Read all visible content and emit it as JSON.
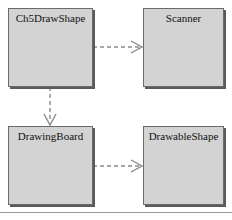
{
  "diagram": {
    "type": "uml-class-dependency-diagram",
    "background_color": "#ffffff",
    "box_fill_color": "#d3d3d3",
    "box_border_color": "#6b6b6b",
    "connector_color": "#8a8a8a",
    "rule_color": "#9a9a9a",
    "classes": [
      {
        "id": "ch5drawshape",
        "label": "Ch5DrawShape"
      },
      {
        "id": "scanner",
        "label": "Scanner"
      },
      {
        "id": "drawingboard",
        "label": "DrawingBoard"
      },
      {
        "id": "drawableshape",
        "label": "DrawableShape"
      }
    ],
    "relationships": [
      {
        "id": "dep-ch5drawshape-scanner",
        "from": "Ch5DrawShape",
        "to": "Scanner",
        "style": "dashed",
        "arrow": "open",
        "kind": "dependency",
        "direction": "horizontal"
      },
      {
        "id": "dep-ch5drawshape-drawingboard",
        "from": "Ch5DrawShape",
        "to": "DrawingBoard",
        "style": "dashed",
        "arrow": "open",
        "kind": "dependency",
        "direction": "vertical"
      },
      {
        "id": "dep-drawingboard-drawableshape",
        "from": "DrawingBoard",
        "to": "DrawableShape",
        "style": "dashed",
        "arrow": "open",
        "kind": "dependency",
        "direction": "horizontal"
      }
    ]
  }
}
